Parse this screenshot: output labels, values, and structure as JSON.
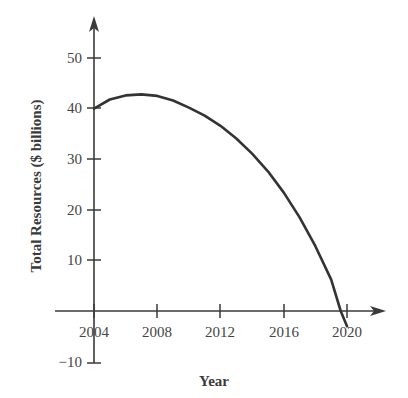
{
  "chart_data": {
    "type": "line",
    "title": "",
    "xlabel": "Year",
    "ylabel": "Total Resources ($ billions)",
    "xlim": [
      2004,
      2020
    ],
    "ylim": [
      -10,
      50
    ],
    "x_ticks": [
      2004,
      2008,
      2012,
      2016,
      2020
    ],
    "y_ticks": [
      -10,
      10,
      20,
      30,
      40,
      50
    ],
    "grid": false,
    "legend": null,
    "series": [
      {
        "name": "Total Resources",
        "x": [
          2004,
          2005,
          2006,
          2007,
          2008,
          2009,
          2010,
          2011,
          2012,
          2013,
          2014,
          2015,
          2016,
          2017,
          2018,
          2019,
          2019.6,
          2020
        ],
        "y": [
          40,
          41.8,
          42.6,
          42.8,
          42.5,
          41.6,
          40.2,
          38.6,
          36.6,
          34.1,
          31.1,
          27.6,
          23.4,
          18.5,
          12.8,
          6.2,
          0,
          -3
        ]
      }
    ]
  },
  "axes": {
    "x_title": "Year",
    "y_title": "Total Resources ($ billions)",
    "x_tick_labels": [
      "2004",
      "2008",
      "2012",
      "2016",
      "2020"
    ],
    "y_tick_labels": [
      "50",
      "40",
      "30",
      "20",
      "10",
      "−10"
    ]
  },
  "colors": {
    "axis": "#3a3a3a",
    "curve": "#333333",
    "text": "#444444",
    "background": "#ffffff"
  }
}
